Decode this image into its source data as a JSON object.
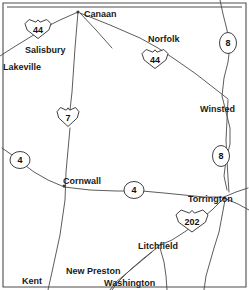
{
  "map": {
    "title": "Northwestern Connecticut road map",
    "region": "Litchfield County, Connecticut",
    "background_color": "#ffffff",
    "line_color": "#4a4a4a",
    "text_color": "#1a1a1a",
    "frame_color": "#4d4d4d",
    "cities": [
      {
        "name": "Canaan",
        "x": 84,
        "y": 11,
        "anchor": "start"
      },
      {
        "name": "Norfolk",
        "x": 148,
        "y": 36,
        "anchor": "start"
      },
      {
        "name": "Salisbury",
        "x": 25,
        "y": 47,
        "anchor": "start"
      },
      {
        "name": "Lakeville",
        "x": 3,
        "y": 64,
        "anchor": "start"
      },
      {
        "name": "Winsted",
        "x": 200,
        "y": 106,
        "anchor": "start"
      },
      {
        "name": "Cornwall",
        "x": 63,
        "y": 178,
        "anchor": "start"
      },
      {
        "name": "Torrington",
        "x": 188,
        "y": 196,
        "anchor": "start"
      },
      {
        "name": "Litchfield",
        "x": 138,
        "y": 243,
        "anchor": "start"
      },
      {
        "name": "Kent",
        "x": 22,
        "y": 278,
        "anchor": "start"
      },
      {
        "name": "New Preston",
        "x": 66,
        "y": 268,
        "anchor": "start"
      },
      {
        "name": "Washington",
        "x": 104,
        "y": 280,
        "anchor": "start"
      }
    ],
    "route_markers": [
      {
        "number": "44",
        "type": "us-shield",
        "x": 38,
        "y": 29,
        "w": 26,
        "h": 19,
        "font_size": 9
      },
      {
        "number": "44",
        "type": "us-shield",
        "x": 155,
        "y": 59,
        "w": 26,
        "h": 19,
        "font_size": 9
      },
      {
        "number": "8",
        "type": "state-oval",
        "x": 228,
        "y": 43,
        "w": 17,
        "h": 21,
        "font_size": 9
      },
      {
        "number": "7",
        "type": "us-shield",
        "x": 68,
        "y": 117,
        "w": 22,
        "h": 19,
        "font_size": 9
      },
      {
        "number": "8",
        "type": "state-oval",
        "x": 221,
        "y": 156,
        "w": 17,
        "h": 21,
        "font_size": 9
      },
      {
        "number": "4",
        "type": "state-oval",
        "x": 20,
        "y": 160,
        "w": 20,
        "h": 17,
        "font_size": 9
      },
      {
        "number": "4",
        "type": "state-oval",
        "x": 134,
        "y": 190,
        "w": 20,
        "h": 17,
        "font_size": 9
      },
      {
        "number": "202",
        "type": "us-shield",
        "x": 192,
        "y": 221,
        "w": 32,
        "h": 22,
        "font_size": 9
      }
    ],
    "roads": [
      {
        "id": "us7-north",
        "label": "Route 7 north",
        "path": "M 78,12 L 75,48 L 72,92 L 70,110"
      },
      {
        "id": "us7-south",
        "label": "Route 7 south",
        "path": "M 70,128 L 68,150 L 66,172 L 65,200 L 60,235 L 52,272 L 48,290"
      },
      {
        "id": "us44-west",
        "label": "Route 44 west",
        "path": "M 78,12 L 60,20 L 48,26 L 32,36 L 14,47 L 0,56"
      },
      {
        "id": "us44-east",
        "label": "Route 44 east",
        "path": "M 80,13 L 110,25 L 140,38 L 158,48 L 176,60 L 196,74 L 214,88 L 228,99"
      },
      {
        "id": "canaan-spur",
        "label": "Canaan southeast spur",
        "path": "M 80,13 L 96,30 L 112,48"
      },
      {
        "id": "rt8-north",
        "label": "Route 8 north",
        "path": "M 220,0 L 223,14 L 227,30 L 230,46 L 228,62 L 224,78 L 222,96 L 226,112 L 230,128 L 230,144 L 226,160 L 224,176 L 227,190"
      },
      {
        "id": "winsted-south",
        "label": "Winsted to Torrington",
        "path": "M 228,100 L 227,120 L 226,140 L 227,160 L 228,178 L 229,192"
      },
      {
        "id": "rt4-west",
        "label": "Route 4 west segment",
        "path": "M 2,148 L 12,155 L 22,163 L 34,172 L 48,180 L 62,186"
      },
      {
        "id": "rt4-east",
        "label": "Route 4 east segment",
        "path": "M 64,187 L 90,190 L 116,191 L 128,191"
      },
      {
        "id": "rt4-east2",
        "label": "Route 4 to Torrington",
        "path": "M 142,191 L 164,193 L 184,195 L 204,197 L 222,197"
      },
      {
        "id": "torr-east",
        "label": "Torrington east road",
        "path": "M 224,197 L 236,192 L 248,188"
      },
      {
        "id": "torr-east2",
        "label": "Torrington southeast",
        "path": "M 224,198 L 238,204 L 249,210"
      },
      {
        "id": "us202-road",
        "label": "Route 202 corridor",
        "path": "M 223,199 L 212,210 L 200,220 L 186,231 L 172,240 L 158,246"
      },
      {
        "id": "litch-south1",
        "label": "Litchfield southwest",
        "path": "M 158,247 L 144,258 L 130,270 L 118,282 L 112,290"
      },
      {
        "id": "litch-south2",
        "label": "Litchfield south",
        "path": "M 160,248 L 164,262 L 166,276 L 167,290"
      },
      {
        "id": "torr-south",
        "label": "Torrington south road",
        "path": "M 225,200 L 222,216 L 219,232 L 214,248 L 210,262 L 206,276 L 204,290"
      },
      {
        "id": "wash-diag",
        "label": "Washington diagonal",
        "path": "M 152,252 L 140,262 L 128,272 L 116,282 L 110,290"
      }
    ],
    "junction_dots": [
      {
        "x": 78,
        "y": 12
      },
      {
        "x": 64,
        "y": 186
      },
      {
        "x": 224,
        "y": 198
      }
    ],
    "frame": {
      "outer": "M 3,3 L 246,3 L 246,287 L 3,287 Z",
      "inner_top": "M 7,7 L 242,7"
    }
  }
}
